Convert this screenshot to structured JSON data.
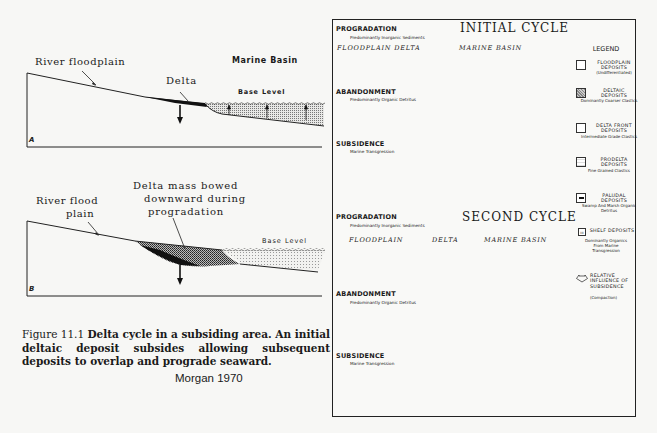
{
  "left_figure": {
    "panel_a": {
      "letter": "A",
      "labels": {
        "river_floodplain": "River floodplain",
        "delta": "Delta",
        "marine_basin": "Marine Basin",
        "base_level": "Base Level"
      }
    },
    "panel_b": {
      "letter": "B",
      "labels": {
        "river_flood_plain_line1": "River flood",
        "river_flood_plain_line2": "plain",
        "delta_mass_line1": "Delta mass bowed",
        "delta_mass_line2": "downward during",
        "delta_mass_line3": "progradation",
        "base_level": "Base Level"
      }
    },
    "caption": {
      "figure_number": "Figure 11.1",
      "text": "Delta cycle in a subsiding area. An initial deltaic deposit subsides allowing subsequent deposits to overlap and prograde seaward."
    },
    "credit": "Morgan 1970"
  },
  "right_figure": {
    "cycles": [
      {
        "title": "INITIAL CYCLE",
        "stages": [
          {
            "title": "PROGRADATION",
            "subtitle": "Predominantly Inorganic Sediments",
            "regions": [
              "FLOODPLAIN DELTA",
              "MARINE BASIN"
            ]
          },
          {
            "title": "ABANDONMENT",
            "subtitle": "Predominantly Organic Detritus"
          },
          {
            "title": "SUBSIDENCE",
            "subtitle": "Marine Transgression"
          }
        ]
      },
      {
        "title": "SECOND CYCLE",
        "stages": [
          {
            "title": "PROGRADATION",
            "subtitle": "Predominantly Inorganic Sediments",
            "regions": [
              "FLOODPLAIN",
              "DELTA",
              "MARINE BASIN"
            ]
          },
          {
            "title": "ABANDONMENT",
            "subtitle": "Predominantly Organic Detritus"
          },
          {
            "title": "SUBSIDENCE",
            "subtitle": "Marine Transgression"
          }
        ]
      }
    ],
    "legend": {
      "title": "LEGEND",
      "items": [
        {
          "name": "FLOODPLAIN DEPOSITS",
          "desc": "(Undifferentiated)",
          "swatch": "blank"
        },
        {
          "name": "DELTAIC DEPOSITS",
          "desc": "Dominantly Coarser Clastics",
          "swatch": "stipple-dense"
        },
        {
          "name": "DELTA FRONT DEPOSITS",
          "desc": "Intermediate Grade Clastics",
          "swatch": "blank"
        },
        {
          "name": "PRODELTA DEPOSITS",
          "desc": "Fine Grained Clastics",
          "swatch": "stipple-light"
        },
        {
          "name": "PALUDAL DEPOSITS",
          "desc": "Swamp And Marsh Organic Detritus",
          "swatch": "dash"
        },
        {
          "name": "SHELF DEPOSITS",
          "desc": "Dominantly Organics From Marine Transgression",
          "swatch": "tick"
        },
        {
          "name": "RELATIVE INFLUENCE OF SUBSIDENCE",
          "desc": "(Compaction)",
          "swatch": "arrow"
        }
      ]
    }
  },
  "colors": {
    "ink": "#1a1a1a",
    "paper": "#f7f7f5",
    "stipple": "#9a9a9a"
  }
}
